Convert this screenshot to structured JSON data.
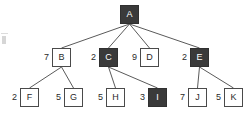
{
  "diagram": {
    "type": "tree",
    "canvas": {
      "width": 246,
      "height": 119
    },
    "colors": {
      "node_fill_white": "#ffffff",
      "node_fill_dark": "#3a3a3a",
      "node_stroke": "#4a4a4a",
      "edge_stroke": "#5a5a5a",
      "text_dark": "#2a2a2a",
      "text_light": "#ffffff",
      "background": "#ffffff"
    },
    "levels": [
      {
        "index": 0,
        "y": 5
      },
      {
        "index": 1,
        "y": 48
      },
      {
        "index": 2,
        "y": 88
      }
    ],
    "nodes": [
      {
        "id": "A",
        "label": "A",
        "value": "",
        "fill": "dark",
        "level": 0,
        "x": 120,
        "y": 5,
        "has_value_label": false
      },
      {
        "id": "B",
        "label": "B",
        "value": "7",
        "fill": "white",
        "level": 1,
        "x": 52,
        "y": 48,
        "has_value_label": true
      },
      {
        "id": "C",
        "label": "C",
        "value": "2",
        "fill": "dark",
        "level": 1,
        "x": 99,
        "y": 48,
        "has_value_label": true
      },
      {
        "id": "D",
        "label": "D",
        "value": "9",
        "fill": "white",
        "level": 1,
        "x": 140,
        "y": 48,
        "has_value_label": true
      },
      {
        "id": "E",
        "label": "E",
        "value": "2",
        "fill": "dark",
        "level": 1,
        "x": 190,
        "y": 48,
        "has_value_label": true
      },
      {
        "id": "F",
        "label": "F",
        "value": "2",
        "fill": "white",
        "level": 2,
        "x": 20,
        "y": 88,
        "has_value_label": true
      },
      {
        "id": "G",
        "label": "G",
        "value": "5",
        "fill": "white",
        "level": 2,
        "x": 64,
        "y": 88,
        "has_value_label": true
      },
      {
        "id": "H",
        "label": "H",
        "value": "5",
        "fill": "white",
        "level": 2,
        "x": 106,
        "y": 88,
        "has_value_label": true
      },
      {
        "id": "I",
        "label": "I",
        "value": "3",
        "fill": "dark",
        "level": 2,
        "x": 148,
        "y": 88,
        "has_value_label": true
      },
      {
        "id": "J",
        "label": "J",
        "value": "7",
        "fill": "white",
        "level": 2,
        "x": 188,
        "y": 88,
        "has_value_label": true
      },
      {
        "id": "K",
        "label": "K",
        "value": "5",
        "fill": "white",
        "level": 2,
        "x": 224,
        "y": 88,
        "has_value_label": true
      }
    ],
    "edges": [
      {
        "from": "A",
        "to": "B",
        "x1": 129.5,
        "y1": 24,
        "x2": 61.5,
        "y2": 48
      },
      {
        "from": "A",
        "to": "C",
        "x1": 129.5,
        "y1": 24,
        "x2": 108.5,
        "y2": 48
      },
      {
        "from": "A",
        "to": "D",
        "x1": 129.5,
        "y1": 24,
        "x2": 149.5,
        "y2": 48
      },
      {
        "from": "A",
        "to": "E",
        "x1": 129.5,
        "y1": 24,
        "x2": 199.5,
        "y2": 48
      },
      {
        "from": "B",
        "to": "F",
        "x1": 61.5,
        "y1": 67,
        "x2": 29.5,
        "y2": 88
      },
      {
        "from": "B",
        "to": "G",
        "x1": 61.5,
        "y1": 67,
        "x2": 73.5,
        "y2": 88
      },
      {
        "from": "C",
        "to": "H",
        "x1": 108.5,
        "y1": 67,
        "x2": 115.5,
        "y2": 88
      },
      {
        "from": "C",
        "to": "I",
        "x1": 108.5,
        "y1": 67,
        "x2": 157.5,
        "y2": 88
      },
      {
        "from": "E",
        "to": "J",
        "x1": 199.5,
        "y1": 67,
        "x2": 197.5,
        "y2": 88
      },
      {
        "from": "E",
        "to": "K",
        "x1": 199.5,
        "y1": 67,
        "x2": 233.5,
        "y2": 88
      }
    ]
  }
}
